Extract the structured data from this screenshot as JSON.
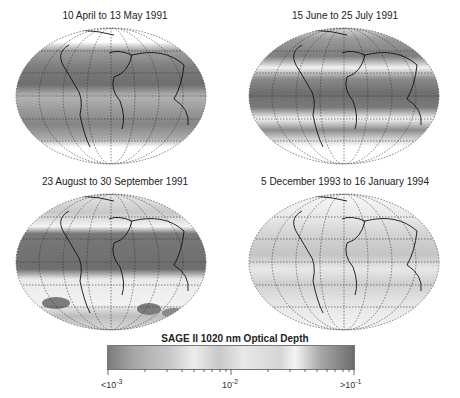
{
  "panels": [
    {
      "title": "10 April to 13 May 1991"
    },
    {
      "title": "15 June to 25 July 1991"
    },
    {
      "title": "23 August to 30 September 1991"
    },
    {
      "title": "5 December 1993 to 16 January 1994"
    }
  ],
  "colorbar": {
    "title": "SAGE II 1020 nm Optical Depth",
    "labels": [
      {
        "prefix": "<10",
        "exp": "-3"
      },
      {
        "prefix": "10",
        "exp": "-2"
      },
      {
        "prefix": ">10",
        "exp": "-1"
      }
    ],
    "colors": {
      "low": "#7a7a7a",
      "mid": "#ececec",
      "high": "#6c6c6c"
    }
  }
}
